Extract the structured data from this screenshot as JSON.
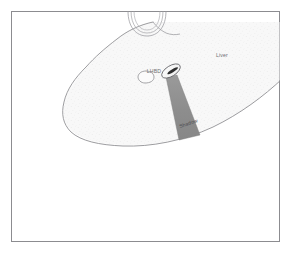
{
  "figure": {
    "kind": "anatomical-line-drawing",
    "caption_present": false,
    "frame": {
      "border_color": "#8c8c90",
      "background_color": "#ffffff",
      "x": 11,
      "y": 11,
      "width": 269,
      "height": 231
    },
    "palette": {
      "outline": "#8a8a8e",
      "organ_fill": "#f7f7f7",
      "organ_stipple": "#dedede",
      "shadow_wedge": "#8e8e8e",
      "shadow_wedge_edge": "#6f6f6f",
      "needle_ellipse_fill": "#fbfbfb",
      "needle_core": "#2b2b2b",
      "label_color": "#6e6e72"
    },
    "labels": [
      {
        "id": "liver",
        "text": "Liver",
        "x": 222,
        "y": 57,
        "anchor": "middle",
        "target": "liver-parenchyma"
      },
      {
        "id": "lhbd",
        "text": "LHBD",
        "x": 154,
        "y": 73,
        "anchor": "middle",
        "target": "left-hepatic-bile-duct"
      },
      {
        "id": "shadow",
        "text": "Shadow",
        "x": 189,
        "y": 125,
        "anchor": "middle",
        "rotation": -19,
        "target": "acoustic-shadow-wedge"
      }
    ],
    "structures": [
      {
        "id": "liver-parenchyma",
        "name": "liver-outline",
        "description": "Large wedge-shaped liver cross-section occupying upper-centre-right of the frame"
      },
      {
        "id": "vessel-arcs",
        "name": "vessel-cross-section-arcs",
        "description": "Three concentric arcs at top centre representing a tubular vessel in cross-section",
        "arc_count": 3
      },
      {
        "id": "left-hepatic-bile-duct",
        "name": "bile-duct-oval",
        "description": "Small rounded oval duct left of the needle tip"
      },
      {
        "id": "needle-tip",
        "name": "needle-tip-ellipse",
        "description": "Tilted ellipse with dark core representing the needle / probe tip"
      },
      {
        "id": "acoustic-shadow-wedge",
        "name": "acoustic-shadow",
        "description": "Grey tapering wedge extending inferiorly from the needle tip"
      }
    ]
  }
}
